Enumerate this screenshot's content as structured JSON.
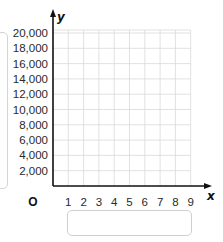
{
  "graph": {
    "x_axis": {
      "name": "x",
      "origin_label": "O",
      "ticks": [
        "1",
        "2",
        "3",
        "4",
        "5",
        "6",
        "7",
        "8",
        "9"
      ]
    },
    "y_axis": {
      "name": "y",
      "ticks": [
        "20,000",
        "18,000",
        "16,000",
        "14,000",
        "12,000",
        "10,000",
        "8,000",
        "6,000",
        "4,000",
        "2,000"
      ]
    }
  },
  "answer_box": {
    "value": ""
  }
}
